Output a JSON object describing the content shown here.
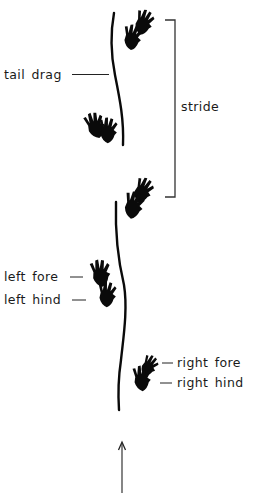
{
  "diagram": {
    "labels": {
      "tail_drag": "tail drag",
      "stride": "stride",
      "left_fore": "left fore",
      "left_hind": "left hind",
      "right_fore": "right fore",
      "right_hind": "right hind"
    },
    "direction_arrow": "up",
    "colors": {
      "ink": "#0a0a0a",
      "background": "#ffffff"
    }
  }
}
